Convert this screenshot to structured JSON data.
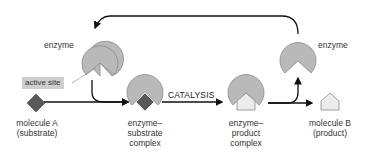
{
  "labels": {
    "enzyme_left": "enzyme",
    "enzyme_right": "enzyme",
    "active_site": "active site",
    "catalysis": "CATALYSIS",
    "molecule_a": [
      "molecule A",
      "(substrate)"
    ],
    "es_complex": [
      "enzyme–",
      "substrate",
      "complex"
    ],
    "ep_complex": [
      "enzyme–",
      "product",
      "complex"
    ],
    "molecule_b": [
      "molecule B",
      "(product)"
    ]
  },
  "colors": {
    "enzyme_fill": "#b9b9b9",
    "enzyme_stroke": "#8a8a8a",
    "substrate_fill": "#595959",
    "product_fill": "#ececec",
    "product_stroke": "#8a8a8a",
    "arrow": "#111111",
    "active_site_bg": "#cfcfcf"
  }
}
